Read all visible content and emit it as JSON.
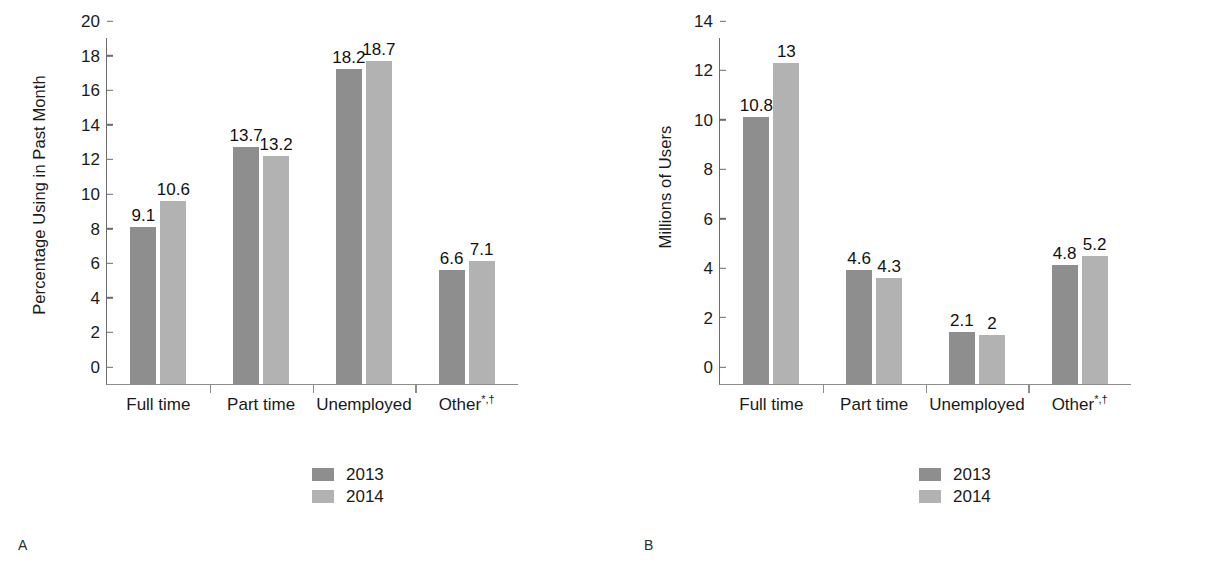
{
  "figure": {
    "panels": [
      {
        "letter": "A",
        "ylabel": "Percentage Using in Past Month"
      },
      {
        "letter": "B",
        "ylabel": "Millions of Users"
      }
    ]
  },
  "colors": {
    "series_2013": "#8e8e8e",
    "series_2014": "#b2b2b2",
    "axis": "#6b6b6b",
    "text": "#1a1a1a",
    "background": "#ffffff"
  },
  "legend": {
    "entries": [
      {
        "label": "2013",
        "color": "#8e8e8e"
      },
      {
        "label": "2014",
        "color": "#b2b2b2"
      }
    ]
  },
  "categories": [
    {
      "text": "Full time",
      "sup": ""
    },
    {
      "text": "Part time",
      "sup": ""
    },
    {
      "text": "Unemployed",
      "sup": ""
    },
    {
      "text": "Other",
      "sup": "*,†"
    }
  ],
  "chart_data": [
    {
      "type": "bar",
      "panel": "A",
      "title": "",
      "xlabel": "",
      "ylabel": "Percentage Using in Past Month",
      "categories": [
        "Full time",
        "Part time",
        "Unemployed",
        "Other*,†"
      ],
      "series": [
        {
          "name": "2013",
          "values": [
            9.1,
            13.7,
            18.2,
            6.6
          ],
          "color": "#8e8e8e"
        },
        {
          "name": "2014",
          "values": [
            10.6,
            13.2,
            18.7,
            7.1
          ],
          "color": "#b2b2b2"
        }
      ],
      "ylim": [
        0,
        20
      ],
      "yticks": [
        0,
        2,
        4,
        6,
        8,
        10,
        12,
        14,
        16,
        18,
        20
      ],
      "ytick_labels": [
        "0",
        "2",
        "4",
        "6",
        "8",
        "10",
        "12",
        "14",
        "16",
        "18",
        "20"
      ],
      "data_labels": [
        [
          "9.1",
          "13.7",
          "18.2",
          "6.6"
        ],
        [
          "10.6",
          "13.2",
          "18.7",
          "7.1"
        ]
      ],
      "grid": false,
      "legend_position": "bottom-center"
    },
    {
      "type": "bar",
      "panel": "B",
      "title": "",
      "xlabel": "",
      "ylabel": "Millions of Users",
      "categories": [
        "Full time",
        "Part time",
        "Unemployed",
        "Other*,†"
      ],
      "series": [
        {
          "name": "2013",
          "values": [
            10.8,
            4.6,
            2.1,
            4.8
          ],
          "color": "#8e8e8e"
        },
        {
          "name": "2014",
          "values": [
            13,
            4.3,
            2,
            5.2
          ],
          "color": "#b2b2b2"
        }
      ],
      "ylim": [
        0,
        14
      ],
      "yticks": [
        0,
        2,
        4,
        6,
        8,
        10,
        12,
        14
      ],
      "ytick_labels": [
        "0",
        "2",
        "4",
        "6",
        "8",
        "10",
        "12",
        "14"
      ],
      "data_labels": [
        [
          "10.8",
          "4.6",
          "2.1",
          "4.8"
        ],
        [
          "13",
          "4.3",
          "2",
          "5.2"
        ]
      ],
      "grid": false,
      "legend_position": "bottom-center"
    }
  ]
}
